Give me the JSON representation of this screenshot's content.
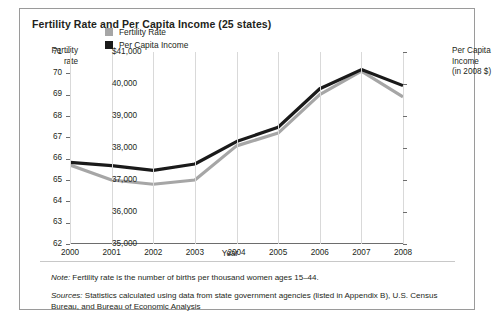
{
  "figure": {
    "title": "Fertility Rate and Per Capita Income (25 states)",
    "note_prefix": "Note:",
    "note_text": " Fertility rate is the number of births per thousand women ages 15–44.",
    "sources_prefix": "Sources:",
    "sources_text": " Statistics calculated using data from state government agencies (listed in Appendix B), U.S. Census Bureau, and Bureau of Economic Analysis"
  },
  "axis_titles": {
    "left_line1": "Fertility",
    "left_line2": "rate",
    "right_line1": "Per Capita",
    "right_line2": "Income",
    "right_line3": "(in 2008 $)",
    "x": "Year"
  },
  "colors": {
    "fertility": "#a6a6a6",
    "income": "#1a1a1a",
    "axis": "#6d6d6d",
    "grid": "#d9d9d9",
    "border": "#9a9a9a",
    "text": "#231f20"
  },
  "chart_data": {
    "type": "line",
    "title": "Fertility Rate and Per Capita Income (25 states)",
    "xlabel": "Year",
    "ylabel": "Fertility rate",
    "y2label": "Per Capita Income (in 2008 $)",
    "grid": true,
    "legend_position": "upper-left-inside",
    "x": [
      2000,
      2001,
      2002,
      2003,
      2004,
      2005,
      2006,
      2007,
      2008
    ],
    "xtick_labels": [
      "2000",
      "2001",
      "2002",
      "2003",
      "2004",
      "2005",
      "2006",
      "2007",
      "2008"
    ],
    "ylim": [
      62,
      71
    ],
    "ytick_labels": [
      "62",
      "63",
      "64",
      "65",
      "66",
      "67",
      "68",
      "69",
      "70",
      "71"
    ],
    "ytick_values": [
      62,
      63,
      64,
      65,
      66,
      67,
      68,
      69,
      70,
      71
    ],
    "y2lim": [
      35000,
      41000
    ],
    "y2tick_labels": [
      "35,000",
      "36,000",
      "37,000",
      "38,000",
      "39,000",
      "40,000",
      "$41,000"
    ],
    "y2tick_values": [
      35000,
      36000,
      37000,
      38000,
      39000,
      40000,
      41000
    ],
    "series": [
      {
        "name": "Fertility Rate",
        "axis": "left",
        "color": "#a6a6a6",
        "values": [
          65.7,
          65.0,
          64.8,
          65.0,
          66.6,
          67.2,
          69.0,
          70.1,
          68.9
        ]
      },
      {
        "name": "Per Capita Income",
        "axis": "right",
        "color": "#1a1a1a",
        "values": [
          37550,
          37450,
          37300,
          37500,
          38200,
          38650,
          39850,
          40450,
          39950
        ]
      }
    ]
  }
}
